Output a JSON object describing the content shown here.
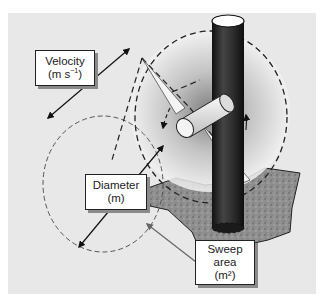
{
  "diagram": {
    "labels": {
      "velocity": {
        "line1": "Velocity",
        "line2_prefix": "(m s",
        "line2_sup": "−1",
        "line2_suffix": ")"
      },
      "diameter": {
        "line1": "Diameter",
        "line2": "(m)"
      },
      "sweep": {
        "line1": "Sweep",
        "line2": "area",
        "line3": "(m²)"
      }
    },
    "colors": {
      "background": "#e6e6e6",
      "pole": "#2b2b2b",
      "ground": "#8c8c8c",
      "dash": "#222222",
      "dash_light": "#555555",
      "box_border": "#222222"
    }
  }
}
